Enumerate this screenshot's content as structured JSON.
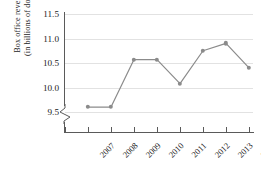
{
  "chart_data": {
    "type": "line",
    "title": "",
    "xlabel": "",
    "ylabel": "Box office revenues (in billions of dollars)",
    "ylabel_line1": "Box office revenues",
    "ylabel_line2": "(in billions of dollars)",
    "categories": [
      "2007",
      "2008",
      "2009",
      "2010",
      "2011",
      "2012",
      "2013",
      "2014"
    ],
    "values": [
      9.6,
      9.6,
      10.57,
      10.57,
      10.08,
      10.75,
      10.9,
      10.4
    ],
    "ytick_labels": [
      "11.5",
      "11.0",
      "10.5",
      "10.0",
      "9.5"
    ],
    "ytick_values": [
      11.5,
      11.0,
      10.5,
      10.0,
      9.5
    ],
    "ylim": [
      9.5,
      11.5
    ],
    "grid": true,
    "axis_break": true,
    "legend": "none",
    "series": [
      {
        "name": "Box office revenues",
        "values": [
          9.6,
          9.6,
          10.57,
          10.57,
          10.08,
          10.75,
          10.9,
          10.4
        ],
        "color": "#8b8b8b",
        "marker": "circle"
      }
    ],
    "colors": {
      "line": "#8b8b8b",
      "marker": "#8b8b8b",
      "grid": "#e2e2e2",
      "axis": "#5a5a5a",
      "text": "#1a1a1a",
      "background": "#ffffff"
    }
  }
}
